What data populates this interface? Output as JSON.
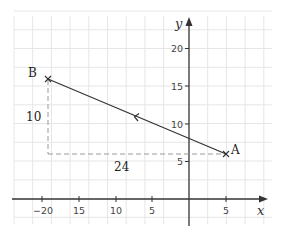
{
  "diagram": {
    "type": "coordinate-plane",
    "axes": {
      "x_label": "x",
      "y_label": "y",
      "x_ticks": [
        {
          "value": -20,
          "label": "−20"
        },
        {
          "value": -15,
          "label": "15"
        },
        {
          "value": -10,
          "label": "10"
        },
        {
          "value": -5,
          "label": "5"
        },
        {
          "value": 5,
          "label": "5"
        }
      ],
      "y_ticks": [
        {
          "value": 5,
          "label": "5"
        },
        {
          "value": 10,
          "label": "10"
        },
        {
          "value": 15,
          "label": "15"
        },
        {
          "value": 20,
          "label": "20"
        }
      ]
    },
    "points": {
      "A": {
        "label": "A",
        "x": 5,
        "y": 6
      },
      "B": {
        "label": "B",
        "x": -19,
        "y": 16
      }
    },
    "segment": {
      "from": "A",
      "to": "B",
      "arrow_direction": "toward B"
    },
    "dimensions": {
      "vertical": {
        "label": "10"
      },
      "horizontal": {
        "label": "24"
      }
    },
    "colors": {
      "grid": "#e6e6e6",
      "axis": "#333333",
      "dashed": "#999999"
    }
  }
}
